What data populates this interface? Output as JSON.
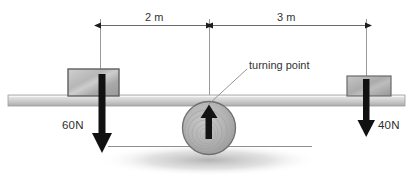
{
  "diagram": {
    "dimensions": [
      {
        "name": "left-span",
        "label": "2 m",
        "value": 2,
        "unit": "m",
        "from_x": 100,
        "to_x": 207
      },
      {
        "name": "right-span",
        "label": "3 m",
        "value": 3,
        "unit": "m",
        "from_x": 212,
        "to_x": 366
      }
    ],
    "forces": [
      {
        "name": "left-force",
        "label": "60N",
        "value": 60,
        "unit": "N",
        "direction": "down",
        "x": 102
      },
      {
        "name": "right-force",
        "label": "40N",
        "value": 40,
        "unit": "N",
        "direction": "down",
        "x": 366
      }
    ],
    "fulcrum": {
      "label": "turning point",
      "center_x": 209,
      "center_y": 128,
      "radius": 26,
      "reaction_direction": "up"
    },
    "colors": {
      "beam_light": "#e6e6e6",
      "beam_dark": "#a8a8a8",
      "block_light": "#d8d8d8",
      "block_dark": "#8d8d8d",
      "arrow": "#111111",
      "line": "#4a4a4a",
      "text": "#333333",
      "shadow": "#bfbfbf"
    }
  }
}
